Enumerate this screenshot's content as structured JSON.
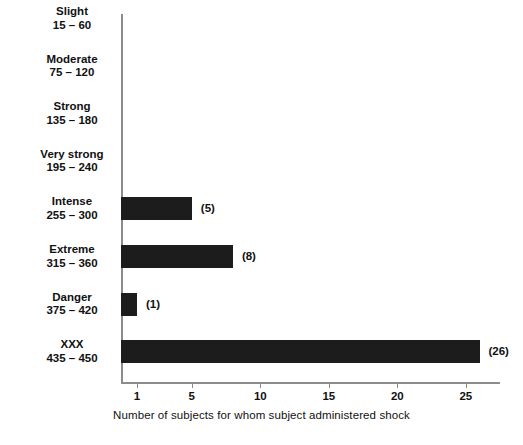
{
  "chart_data": {
    "type": "bar",
    "orientation": "horizontal",
    "title": "",
    "xlabel": "Number of subjects for whom subject administered shock",
    "ylabel": "Shock-generating voltage and description",
    "categories": [
      "Slight\n15 – 60",
      "Moderate\n75 – 120",
      "Strong\n135 – 180",
      "Very strong\n195 – 240",
      "Intense\n255 – 300",
      "Extreme\n315 – 360",
      "Danger\n375 – 420",
      "XXX\n435 – 450"
    ],
    "category_names": [
      "Slight",
      "Moderate",
      "Strong",
      "Very strong",
      "Intense",
      "Extreme",
      "Danger",
      "XXX"
    ],
    "category_ranges": [
      "15 – 60",
      "75 – 120",
      "135 – 180",
      "195 – 240",
      "255 – 300",
      "315 – 360",
      "375 – 420",
      "435 – 450"
    ],
    "values": [
      0,
      0,
      0,
      0,
      5,
      8,
      1,
      26
    ],
    "data_labels": [
      "",
      "",
      "",
      "",
      "(5)",
      "(8)",
      "(1)",
      "(26)"
    ],
    "xticks": [
      1,
      5,
      10,
      15,
      20,
      25
    ],
    "xtick_labels": [
      "1",
      "5",
      "10",
      "15",
      "20",
      "25"
    ],
    "xlim": [
      0,
      27.7
    ],
    "grid": false,
    "legend": null,
    "bar_color": "#1c1c1c",
    "axis_color": "#8c8c8c",
    "background_color": "#ffffff"
  },
  "rows": [
    {
      "name": "Slight",
      "range": "15 – 60",
      "value": 0,
      "label": ""
    },
    {
      "name": "Moderate",
      "range": "75 – 120",
      "value": 0,
      "label": ""
    },
    {
      "name": "Strong",
      "range": "135 – 180",
      "value": 0,
      "label": ""
    },
    {
      "name": "Very strong",
      "range": "195 – 240",
      "value": 0,
      "label": ""
    },
    {
      "name": "Intense",
      "range": "255 – 300",
      "value": 5,
      "label": "(5)"
    },
    {
      "name": "Extreme",
      "range": "315 – 360",
      "value": 8,
      "label": "(8)"
    },
    {
      "name": "Danger",
      "range": "375 – 420",
      "value": 1,
      "label": "(1)"
    },
    {
      "name": "XXX",
      "range": "435 – 450",
      "value": 26,
      "label": "(26)"
    }
  ],
  "axes": {
    "x_title": "Number of subjects for whom subject administered shock",
    "y_title": "Shock-generating voltage and description",
    "x_tick_labels": [
      "1",
      "5",
      "10",
      "15",
      "20",
      "25"
    ]
  }
}
